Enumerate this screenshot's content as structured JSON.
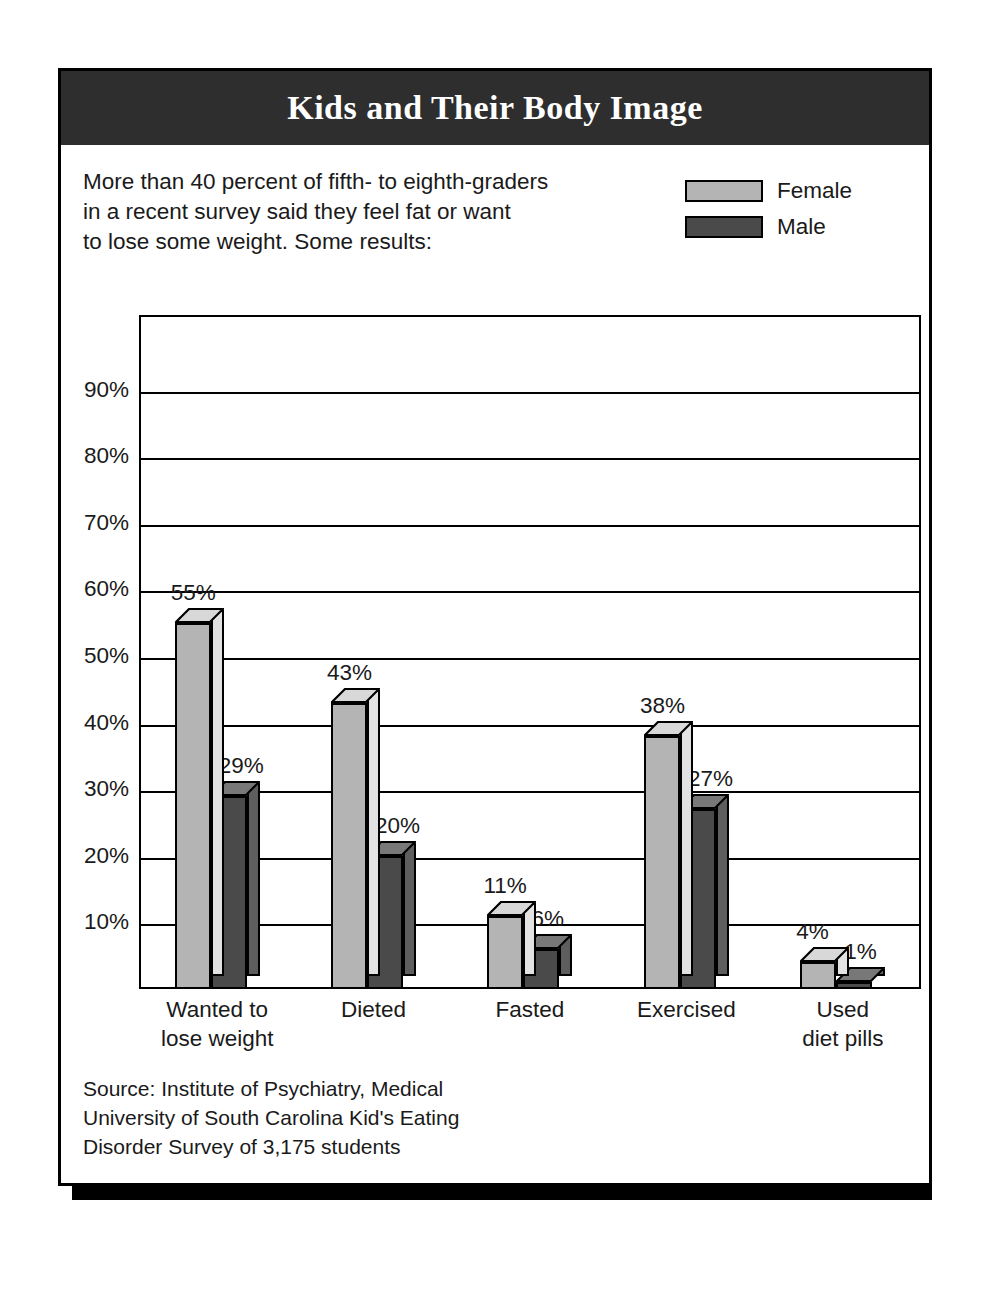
{
  "card": {
    "title": "Kids and Their Body Image",
    "intro": "More than 40 percent of fifth- to eighth-graders\nin a recent survey said they feel fat or want\nto lose some weight. Some results:",
    "source": "Source: Institute of Psychiatry, Medical\nUniversity of South Carolina Kid's Eating\nDisorder Survey of 3,175 students"
  },
  "legend": {
    "items": [
      {
        "label": "Female",
        "color": "#b4b4b4"
      },
      {
        "label": "Male",
        "color": "#4a4a4a"
      }
    ]
  },
  "colors": {
    "female_front": "#b4b4b4",
    "female_top": "#d8d8d8",
    "female_side": "#e2e2e2",
    "male_front": "#4a4a4a",
    "male_top": "#787878",
    "male_side": "#5e5e5e",
    "header_bg": "#2e2e2e",
    "header_text": "#ffffff",
    "ink": "#000000"
  },
  "chart_data": {
    "type": "bar",
    "title": "Kids and Their Body Image",
    "xlabel": "",
    "ylabel": "",
    "ylim": [
      0,
      100
    ],
    "yticks": [
      10,
      20,
      30,
      40,
      50,
      60,
      70,
      80,
      90
    ],
    "ytick_labels": [
      "10%",
      "20%",
      "30%",
      "40%",
      "50%",
      "60%",
      "70%",
      "80%",
      "90%"
    ],
    "grid": true,
    "legend_position": "top-right",
    "categories": [
      "Wanted to\nlose weight",
      "Dieted",
      "Fasted",
      "Exercised",
      "Used\ndiet pills"
    ],
    "series": [
      {
        "name": "Female",
        "values": [
          55,
          43,
          11,
          38,
          4
        ],
        "labels": [
          "55%",
          "43%",
          "11%",
          "38%",
          "4%"
        ]
      },
      {
        "name": "Male",
        "values": [
          29,
          20,
          6,
          27,
          1
        ],
        "labels": [
          "29%",
          "20%",
          "6%",
          "27%",
          "1%"
        ]
      }
    ]
  }
}
